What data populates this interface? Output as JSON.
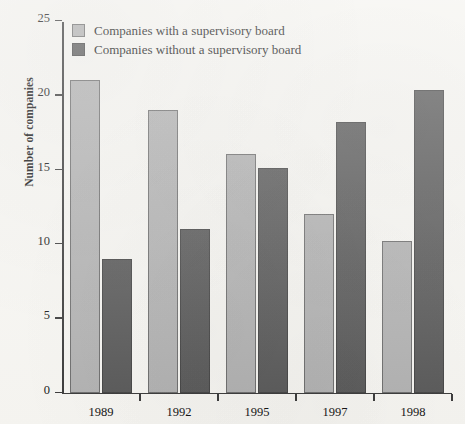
{
  "chart_data": {
    "type": "bar",
    "title": "",
    "subtitle": "",
    "xlabel": "",
    "ylabel": "Number of companies",
    "categories": [
      "1989",
      "1992",
      "1995",
      "1997",
      "1998"
    ],
    "series": [
      {
        "name": "Companies with a supervisory board",
        "color": "#b2b2b2",
        "values": [
          21,
          19,
          16,
          12,
          10.2
        ]
      },
      {
        "name": "Companies without a supervisory board",
        "color": "#595959",
        "values": [
          9,
          11,
          15.1,
          18.2,
          20.3
        ]
      }
    ],
    "ylim": [
      0,
      25
    ],
    "yticks": [
      0,
      5,
      10,
      15,
      20,
      25
    ],
    "ytick_labels": [
      "0",
      "5",
      "10",
      "15",
      "20",
      "25"
    ],
    "grid": false,
    "legend_position": "top-left-inside",
    "background_color": "#f7f6f2",
    "axis_color": "#3a3a3a"
  }
}
